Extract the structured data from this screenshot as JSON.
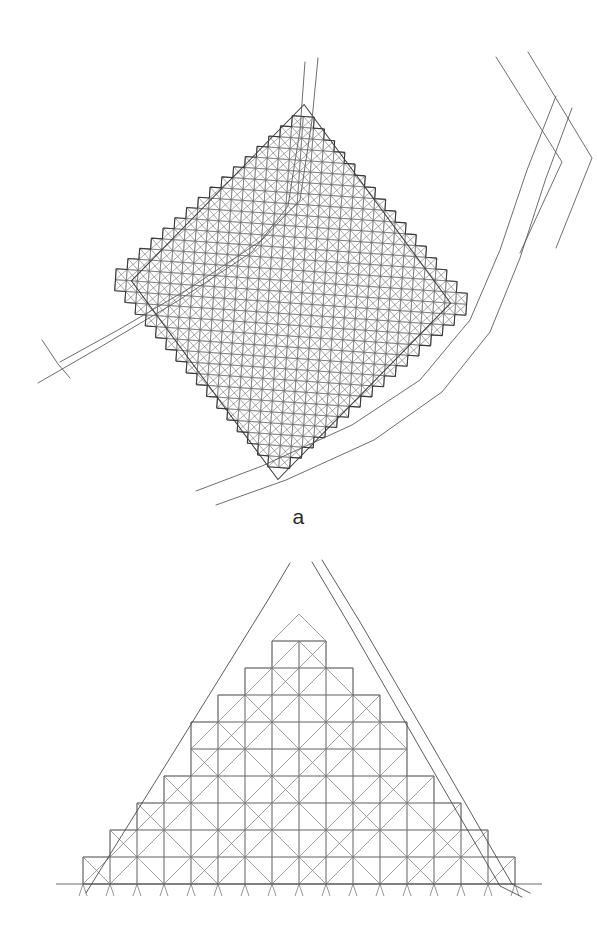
{
  "figure": {
    "background_color": "#ffffff",
    "width": 597,
    "height": 946,
    "panel_count": 2
  },
  "panels": [
    {
      "id": "a",
      "label": "a",
      "label_position": "bottom-center",
      "description": "Diamond-shaped (rotated square) fine triangular mesh region bounded by a curving two-line channel on the lower-left and a bending two-line channel on the right",
      "mesh": {
        "cell_pitch_px": 11,
        "cell_subdivision": "four-triangle-X",
        "rows": 34,
        "cols": 34,
        "outline_shape": "diamond",
        "stair_stepped_boundary": true,
        "line_color": "#6e6e6e",
        "line_width": 0.6,
        "boundary_line_color": "#3a3a3a",
        "boundary_line_width": 1.1,
        "center_x": 291,
        "center_y": 292,
        "half_diagonal_x": 160,
        "half_diagonal_y": 188,
        "rotation_deg": 4
      },
      "channels": [
        {
          "name": "lower-left-channel-bank-outer",
          "color": "#5c5c5c",
          "width": 0.9,
          "points": [
            [
              60,
              362
            ],
            [
              118,
              330
            ],
            [
              190,
              288
            ],
            [
              262,
              240
            ],
            [
              300,
              200
            ],
            [
              312,
              120
            ],
            [
              318,
              58
            ]
          ]
        },
        {
          "name": "lower-left-channel-bank-inner",
          "color": "#5c5c5c",
          "width": 0.9,
          "points": [
            [
              38,
              383
            ],
            [
              102,
              346
            ],
            [
              176,
              302
            ],
            [
              252,
              252
            ],
            [
              288,
              206
            ],
            [
              300,
              130
            ],
            [
              305,
              62
            ]
          ]
        },
        {
          "name": "lower-right-channel-bank-outer",
          "color": "#5c5c5c",
          "width": 0.9,
          "points": [
            [
              196,
              491
            ],
            [
              262,
              466
            ],
            [
              352,
              425
            ],
            [
              420,
              380
            ],
            [
              470,
              320
            ],
            [
              500,
              250
            ],
            [
              527,
              170
            ],
            [
              556,
              96
            ]
          ]
        },
        {
          "name": "lower-right-channel-bank-inner",
          "color": "#5c5c5c",
          "width": 0.9,
          "points": [
            [
              216,
              505
            ],
            [
              286,
              480
            ],
            [
              374,
              440
            ],
            [
              442,
              392
            ],
            [
              490,
              332
            ],
            [
              520,
              258
            ],
            [
              546,
              178
            ],
            [
              572,
              108
            ]
          ]
        },
        {
          "name": "tributary-branch",
          "color": "#5c5c5c",
          "width": 0.9,
          "points": [
            [
              42,
              340
            ],
            [
              58,
              364
            ],
            [
              70,
              378
            ]
          ]
        },
        {
          "name": "upper-right-bend-outer",
          "color": "#5c5c5c",
          "width": 0.9,
          "points": [
            [
              496,
              57
            ],
            [
              562,
              162
            ],
            [
              520,
              253
            ]
          ]
        },
        {
          "name": "upper-right-bend-inner",
          "color": "#5c5c5c",
          "width": 0.9,
          "points": [
            [
              528,
              52
            ],
            [
              592,
              158
            ],
            [
              556,
              248
            ]
          ]
        }
      ]
    },
    {
      "id": "b",
      "label": "b",
      "label_position": "bottom-center",
      "description": "Coarse stair-stepped triangular mesh forming a pyramid/triangle shape with a flat base, crossed by two near-straight channel lines; small tick marks below the baseline",
      "mesh": {
        "cell_pitch_px": 27,
        "cell_subdivision": "diagonal-split",
        "rows": 9,
        "base_cols": 16,
        "outline_shape": "stepped-triangle",
        "stair_stepped_boundary": true,
        "line_color": "#777777",
        "line_width": 0.7,
        "baseline_y": 884,
        "apex_x": 299,
        "apex_y": 585,
        "base_left_x": 101,
        "base_right_x": 505,
        "tick_length_px": 12,
        "tick_count": 17
      },
      "channels": [
        {
          "name": "left-channel-line",
          "color": "#4a4a4a",
          "width": 0.9,
          "points": [
            [
              86,
              893
            ],
            [
              180,
              742
            ],
            [
              268,
              600
            ],
            [
              290,
              563
            ]
          ]
        },
        {
          "name": "right-channel-line",
          "color": "#4a4a4a",
          "width": 0.9,
          "points": [
            [
              322,
              560
            ],
            [
              360,
              622
            ],
            [
              430,
              742
            ],
            [
              512,
              884
            ],
            [
              530,
              893
            ]
          ]
        },
        {
          "name": "right-channel-line-parallel",
          "color": "#4a4a4a",
          "width": 0.9,
          "points": [
            [
              312,
              562
            ],
            [
              350,
              626
            ],
            [
              420,
              748
            ],
            [
              500,
              886
            ],
            [
              522,
              897
            ]
          ]
        }
      ]
    }
  ],
  "labels": {
    "panel_a": "a",
    "panel_b": "b"
  },
  "colors": {
    "background": "#ffffff",
    "mesh_line": "#6e6e6e",
    "mesh_boundary": "#3a3a3a",
    "channel_line": "#5c5c5c",
    "label_text": "#2b2b2b"
  }
}
